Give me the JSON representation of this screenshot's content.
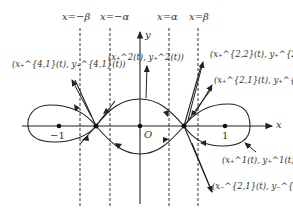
{
  "diagram": {
    "vertical_lines": [
      {
        "label": "x=−β",
        "x": 80
      },
      {
        "label": "x=−α",
        "x": 110
      },
      {
        "label": "x=α",
        "x": 169
      },
      {
        "label": "x=β",
        "x": 198
      }
    ],
    "axes": {
      "x_label": "x",
      "y_label": "y",
      "origin_label": "O"
    },
    "ticks": {
      "neg_one": "−1",
      "one": "1"
    },
    "curve_labels": {
      "left_upper": "(x₊^{4,1}(t), y₊^{4,1}(t))",
      "center_top": "(x₊^2(t), y₊^2(t))",
      "right_upper1": "(x₊^{2,2}(t), y₊^{2,2}(t))",
      "right_upper2": "(x₊^{2,1}(t), y₊^{2,1}(t))",
      "right_mid": "(x₊^1(t), y₊^1(t))",
      "right_lower": "(x₋^{2,1}(t), y₋^{2,1}(t))"
    }
  }
}
